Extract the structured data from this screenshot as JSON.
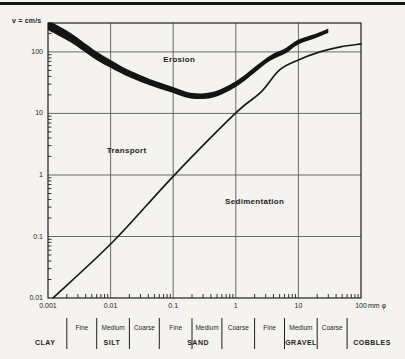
{
  "chart_data": {
    "type": "line",
    "title": "",
    "ylabel": "v = cm/s",
    "x_unit": "mm φ",
    "x_scale": "log",
    "y_scale": "log",
    "xlim": [
      0.001,
      100
    ],
    "ylim": [
      0.01,
      295
    ],
    "grid": true,
    "x_tick_values": [
      0.001,
      0.01,
      0.1,
      1,
      10,
      100
    ],
    "x_tick_labels": [
      "0.001",
      "0.01",
      "0.1",
      "1",
      "10",
      "100"
    ],
    "y_tick_values": [
      0.01,
      0.1,
      1,
      10,
      100
    ],
    "y_tick_labels": [
      "0.01",
      "0.1",
      "1",
      "10",
      "100"
    ],
    "zones": [
      {
        "label": "Erosion",
        "d_mm": 0.125,
        "v_cms": 73
      },
      {
        "label": "Transport",
        "d_mm": 0.018,
        "v_cms": 2.5
      },
      {
        "label": "Sedimentation",
        "d_mm": 2.0,
        "v_cms": 0.37
      }
    ],
    "series": [
      {
        "name": "erosion velocity band",
        "style": "band",
        "points": [
          [
            0.001,
            275
          ],
          [
            0.0023,
            170
          ],
          [
            0.0057,
            89
          ],
          [
            0.01,
            64
          ],
          [
            0.02,
            44
          ],
          [
            0.043,
            32
          ],
          [
            0.1,
            24
          ],
          [
            0.19,
            19.5
          ],
          [
            0.42,
            20
          ],
          [
            1,
            30
          ],
          [
            2,
            51
          ],
          [
            3.6,
            80
          ],
          [
            6.2,
            104
          ],
          [
            10,
            145
          ],
          [
            19,
            182
          ],
          [
            30,
            220
          ]
        ]
      },
      {
        "name": "settling velocity curve",
        "style": "line",
        "points": [
          [
            0.0012,
            0.01
          ],
          [
            0.011,
            0.083
          ],
          [
            0.1,
            0.95
          ],
          [
            1,
            10.2
          ],
          [
            2.5,
            22
          ],
          [
            5,
            51
          ],
          [
            10,
            74
          ],
          [
            22,
            100
          ],
          [
            47,
            121
          ],
          [
            100,
            135
          ]
        ]
      }
    ],
    "grain_size_scale": {
      "boundaries_mm": [
        0.002,
        0.006,
        0.02,
        0.06,
        0.2,
        0.6,
        2,
        6,
        20,
        60
      ],
      "groups": [
        {
          "label": "CLAY",
          "center_mm": 0.0009,
          "subdivisions": []
        },
        {
          "label": "SILT",
          "center_mm": 0.0105,
          "subdivisions": [
            {
              "label": "Fine",
              "from_mm": 0.002,
              "to_mm": 0.006
            },
            {
              "label": "Medium",
              "from_mm": 0.006,
              "to_mm": 0.02
            },
            {
              "label": "Coarse",
              "from_mm": 0.02,
              "to_mm": 0.06
            }
          ]
        },
        {
          "label": "SAND",
          "center_mm": 0.25,
          "subdivisions": [
            {
              "label": "Fine",
              "from_mm": 0.06,
              "to_mm": 0.2
            },
            {
              "label": "Medium",
              "from_mm": 0.2,
              "to_mm": 0.6
            },
            {
              "label": "Coarse",
              "from_mm": 0.6,
              "to_mm": 2
            }
          ]
        },
        {
          "label": "GRAVEL",
          "center_mm": 11,
          "subdivisions": [
            {
              "label": "Fine",
              "from_mm": 2,
              "to_mm": 6
            },
            {
              "label": "Medium",
              "from_mm": 6,
              "to_mm": 20
            },
            {
              "label": "Coarse",
              "from_mm": 20,
              "to_mm": 60
            }
          ]
        },
        {
          "label": "COBBLES",
          "center_mm": 150,
          "subdivisions": []
        }
      ]
    },
    "colors": {
      "background": "#f4f3ef",
      "band": "#141414",
      "curve": "#1a1a1a",
      "grid": "#595959",
      "border": "#1f1f1f",
      "text": "#1e1e1e"
    }
  }
}
